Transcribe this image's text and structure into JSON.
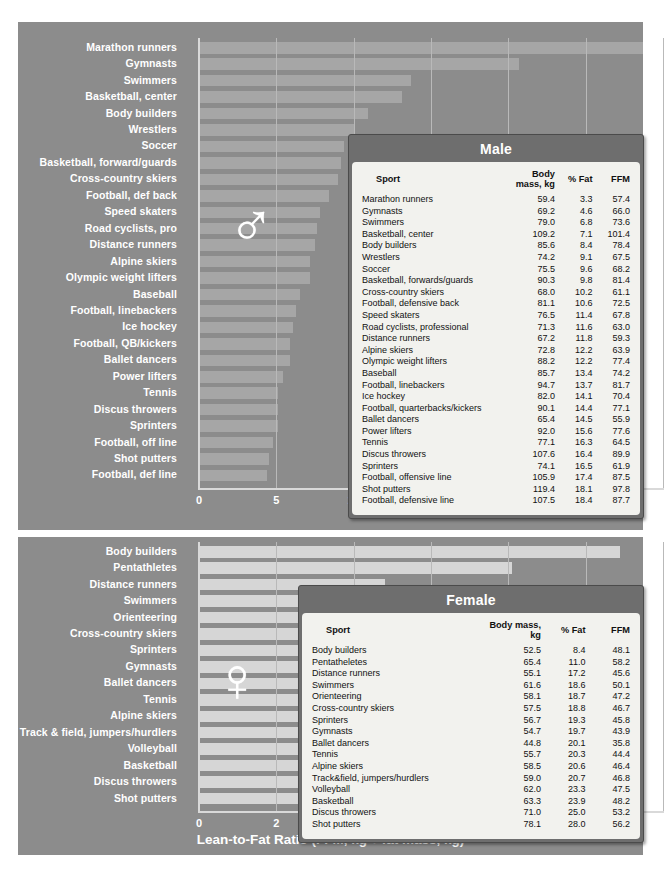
{
  "figure": {
    "xlabel": "Lean-to-Fat Ratio (FFM, kg ÷ fat mass, kg)",
    "male_symbol": "♂",
    "female_symbol": "♀",
    "bar_color_male": "#a6a6a6",
    "bar_color_female": "#d6d6d6",
    "panel_color": "#8c8c8c",
    "table_frame_color": "#6e6e6e",
    "table_body_color": "#f2f2ee"
  },
  "columns": [
    "Sport",
    "Body mass, kg",
    "% Fat",
    "FFM"
  ],
  "male": {
    "title": "Male",
    "xticks": [
      "0",
      "5",
      "10",
      "15",
      "20",
      "25",
      "30"
    ],
    "xlim": [
      0,
      30
    ],
    "chart_categories": [
      "Marathon runners",
      "Gymnasts",
      "Swimmers",
      "Basketball, center",
      "Body builders",
      "Wrestlers",
      "Soccer",
      "Basketball, forward/guards",
      "Cross-country skiers",
      "Football, def back",
      "Speed skaters",
      "Road cyclists, pro",
      "Distance runners",
      "Alpine skiers",
      "Olympic weight lifters",
      "Baseball",
      "Football, linebackers",
      "Ice hockey",
      "Football, QB/kickers",
      "Ballet dancers",
      "Power lifters",
      "Tennis",
      "Discus throwers",
      "Sprinters",
      "Football, off line",
      "Shot putters",
      "Football, def line"
    ],
    "chart_values": [
      28.7,
      20.7,
      13.7,
      13.1,
      10.9,
      10.0,
      9.4,
      9.2,
      9.0,
      8.4,
      7.8,
      7.6,
      7.5,
      7.2,
      7.2,
      6.5,
      6.3,
      6.1,
      5.9,
      5.9,
      5.4,
      5.1,
      5.1,
      5.1,
      4.8,
      4.5,
      4.4
    ],
    "rows": [
      [
        "Marathon runners",
        "59.4",
        "3.3",
        "57.4"
      ],
      [
        "Gymnasts",
        "69.2",
        "4.6",
        "66.0"
      ],
      [
        "Swimmers",
        "79.0",
        "6.8",
        "73.6"
      ],
      [
        "Basketball, center",
        "109.2",
        "7.1",
        "101.4"
      ],
      [
        "Body builders",
        "85.6",
        "8.4",
        "78.4"
      ],
      [
        "Wrestlers",
        "74.2",
        "9.1",
        "67.5"
      ],
      [
        "Soccer",
        "75.5",
        "9.6",
        "68.2"
      ],
      [
        "Basketball, forwards/guards",
        "90.3",
        "9.8",
        "81.4"
      ],
      [
        "Cross-country skiers",
        "68.0",
        "10.2",
        "61.1"
      ],
      [
        "Football, defensive back",
        "81.1",
        "10.6",
        "72.5"
      ],
      [
        "Speed skaters",
        "76.5",
        "11.4",
        "67.8"
      ],
      [
        "Road cyclists, professional",
        "71.3",
        "11.6",
        "63.0"
      ],
      [
        "Distance runners",
        "67.2",
        "11.8",
        "59.3"
      ],
      [
        "Alpine skiers",
        "72.8",
        "12.2",
        "63.9"
      ],
      [
        "Olympic weight lifters",
        "88.2",
        "12.2",
        "77.4"
      ],
      [
        "Baseball",
        "85.7",
        "13.4",
        "74.2"
      ],
      [
        "Football, linebackers",
        "94.7",
        "13.7",
        "81.7"
      ],
      [
        "Ice hockey",
        "82.0",
        "14.1",
        "70.4"
      ],
      [
        "Football, quarterbacks/kickers",
        "90.1",
        "14.4",
        "77.1"
      ],
      [
        "Ballet dancers",
        "65.4",
        "14.5",
        "55.9"
      ],
      [
        "Power lifters",
        "92.0",
        "15.6",
        "77.6"
      ],
      [
        "Tennis",
        "77.1",
        "16.3",
        "64.5"
      ],
      [
        "Discus throwers",
        "107.6",
        "16.4",
        "89.9"
      ],
      [
        "Sprinters",
        "74.1",
        "16.5",
        "61.9"
      ],
      [
        "Football, offensive line",
        "105.9",
        "17.4",
        "87.5"
      ],
      [
        "Shot putters",
        "119.4",
        "18.1",
        "97.8"
      ],
      [
        "Football, defensive line",
        "107.5",
        "18.4",
        "87.7"
      ]
    ]
  },
  "female": {
    "title": "Female",
    "xticks": [
      "0",
      "2",
      "4",
      "6",
      "8",
      "10",
      "12"
    ],
    "xlim": [
      0,
      12
    ],
    "chart_categories": [
      "Body builders",
      "Pentathletes",
      "Distance runners",
      "Swimmers",
      "Orienteering",
      "Cross-country skiers",
      "Sprinters",
      "Gymnasts",
      "Ballet dancers",
      "Tennis",
      "Alpine skiers",
      "Track & field, jumpers/hurdlers",
      "Volleyball",
      "Basketball",
      "Discus throwers",
      "Shot putters"
    ],
    "chart_values": [
      10.9,
      8.1,
      4.8,
      4.4,
      4.3,
      4.3,
      4.2,
      4.1,
      4.0,
      3.9,
      3.8,
      3.8,
      3.3,
      3.2,
      3.0,
      2.6
    ],
    "rows": [
      [
        "Body builders",
        "52.5",
        "8.4",
        "48.1"
      ],
      [
        "Pentatheletes",
        "65.4",
        "11.0",
        "58.2"
      ],
      [
        "Distance runners",
        "55.1",
        "17.2",
        "45.6"
      ],
      [
        "Swimmers",
        "61.6",
        "18.6",
        "50.1"
      ],
      [
        "Orienteering",
        "58.1",
        "18.7",
        "47.2"
      ],
      [
        "Cross-country skiers",
        "57.5",
        "18.8",
        "46.7"
      ],
      [
        "Sprinters",
        "56.7",
        "19.3",
        "45.8"
      ],
      [
        "Gymnasts",
        "54.7",
        "19.7",
        "43.9"
      ],
      [
        "Ballet dancers",
        "44.8",
        "20.1",
        "35.8"
      ],
      [
        "Tennis",
        "55.7",
        "20.3",
        "44.4"
      ],
      [
        "Alpine skiers",
        "58.5",
        "20.6",
        "46.4"
      ],
      [
        "Track&field, jumpers/hurdlers",
        "59.0",
        "20.7",
        "46.8"
      ],
      [
        "Volleyball",
        "62.0",
        "23.3",
        "47.5"
      ],
      [
        "Basketball",
        "63.3",
        "23.9",
        "48.2"
      ],
      [
        "Discus throwers",
        "71.0",
        "25.0",
        "53.2"
      ],
      [
        "Shot putters",
        "78.1",
        "28.0",
        "56.2"
      ]
    ]
  },
  "chart_data": [
    {
      "type": "bar",
      "title": "Male",
      "orientation": "horizontal",
      "xlabel": "Lean-to-Fat Ratio (FFM, kg ÷ fat mass, kg)",
      "ylabel": "",
      "xlim": [
        0,
        30
      ],
      "xticks": [
        0,
        5,
        10,
        15,
        20,
        25,
        30
      ],
      "grid": true,
      "legend": "none",
      "categories": [
        "Marathon runners",
        "Gymnasts",
        "Swimmers",
        "Basketball, center",
        "Body builders",
        "Wrestlers",
        "Soccer",
        "Basketball, forward/guards",
        "Cross-country skiers",
        "Football, def back",
        "Speed skaters",
        "Road cyclists, pro",
        "Distance runners",
        "Alpine skiers",
        "Olympic weight lifters",
        "Baseball",
        "Football, linebackers",
        "Ice hockey",
        "Football, QB/kickers",
        "Ballet dancers",
        "Power lifters",
        "Tennis",
        "Discus throwers",
        "Sprinters",
        "Football, off line",
        "Shot putters",
        "Football, def line"
      ],
      "values": [
        28.7,
        20.7,
        13.7,
        13.1,
        10.9,
        10.0,
        9.4,
        9.2,
        9.0,
        8.4,
        7.8,
        7.6,
        7.5,
        7.2,
        7.2,
        6.5,
        6.3,
        6.1,
        5.9,
        5.9,
        5.4,
        5.1,
        5.1,
        5.1,
        4.8,
        4.5,
        4.4
      ]
    },
    {
      "type": "bar",
      "title": "Female",
      "orientation": "horizontal",
      "xlabel": "Lean-to-Fat Ratio (FFM, kg ÷ fat mass, kg)",
      "ylabel": "",
      "xlim": [
        0,
        12
      ],
      "xticks": [
        0,
        2,
        4,
        6,
        8,
        10,
        12
      ],
      "grid": true,
      "legend": "none",
      "categories": [
        "Body builders",
        "Pentathletes",
        "Distance runners",
        "Swimmers",
        "Orienteering",
        "Cross-country skiers",
        "Sprinters",
        "Gymnasts",
        "Ballet dancers",
        "Tennis",
        "Alpine skiers",
        "Track & field, jumpers/hurdlers",
        "Volleyball",
        "Basketball",
        "Discus throwers",
        "Shot putters"
      ],
      "values": [
        10.9,
        8.1,
        4.8,
        4.4,
        4.3,
        4.3,
        4.2,
        4.1,
        4.0,
        3.9,
        3.8,
        3.8,
        3.3,
        3.2,
        3.0,
        2.6
      ]
    },
    {
      "type": "table",
      "title": "Male",
      "columns": [
        "Sport",
        "Body mass, kg",
        "% Fat",
        "FFM"
      ]
    },
    {
      "type": "table",
      "title": "Female",
      "columns": [
        "Sport",
        "Body mass, kg",
        "% Fat",
        "FFM"
      ]
    }
  ]
}
